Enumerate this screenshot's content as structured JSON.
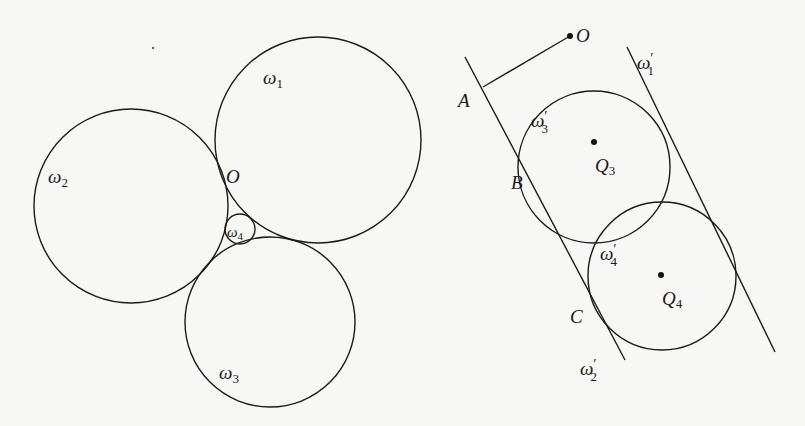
{
  "figure": {
    "left_panel": {
      "circles": [
        {
          "id": "omega1",
          "label": "ω",
          "subscript": "1",
          "cx": 318,
          "cy": 140,
          "r": 103
        },
        {
          "id": "omega2",
          "label": "ω",
          "subscript": "2",
          "cx": 131,
          "cy": 206,
          "r": 97
        },
        {
          "id": "omega3",
          "label": "ω",
          "subscript": "3",
          "cx": 270,
          "cy": 322,
          "r": 85
        },
        {
          "id": "omega4",
          "label": "ω",
          "subscript": "4",
          "cx": 240,
          "cy": 229,
          "r": 15
        }
      ],
      "point_O": {
        "label": "O"
      }
    },
    "right_panel": {
      "point_O": {
        "label": "O"
      },
      "point_A": {
        "label": "A"
      },
      "point_B": {
        "label": "B"
      },
      "point_C": {
        "label": "C"
      },
      "line_omega1_prime": {
        "label": "ω",
        "subscript": "1",
        "prime": "′"
      },
      "line_omega2_prime": {
        "label": "ω",
        "subscript": "2",
        "prime": "′"
      },
      "circle_omega3_prime": {
        "label": "ω",
        "subscript": "3",
        "prime": "′",
        "cx": 594,
        "cy": 167,
        "r": 76
      },
      "circle_omega4_prime": {
        "label": "ω",
        "subscript": "4",
        "prime": "′",
        "cx": 662,
        "cy": 276,
        "r": 74
      },
      "center_Q3": {
        "label": "Q",
        "subscript": "3"
      },
      "center_Q4": {
        "label": "Q",
        "subscript": "4"
      }
    }
  }
}
